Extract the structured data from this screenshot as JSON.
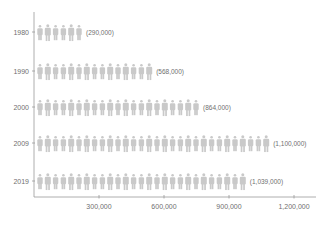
{
  "chart_data": {
    "type": "bar",
    "style": "pictogram",
    "title": "",
    "xlabel": "",
    "ylabel": "",
    "categories": [
      "1980",
      "1990",
      "2000",
      "2009",
      "2019"
    ],
    "values": [
      290000,
      568000,
      864000,
      1100000,
      1039000
    ],
    "value_labels": [
      "(290,000)",
      "(568,000)",
      "(864,000)",
      "(1,100,000)",
      "(1,039,000)"
    ],
    "icon_counts": [
      6,
      15,
      21,
      30,
      27
    ],
    "icon": "person-icon",
    "xticks": [
      300000,
      600000,
      900000,
      1200000
    ],
    "xtick_labels": [
      "300,000",
      "600,000",
      "900,000",
      "1,200,000"
    ],
    "xlim": [
      0,
      1290000
    ],
    "grid": false,
    "legend": "none",
    "colors": {
      "icon": "#c9c9c9",
      "axis": "#9a9a9a",
      "text": "#6f6f6f"
    }
  }
}
